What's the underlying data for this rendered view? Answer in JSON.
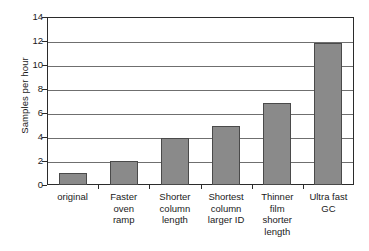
{
  "chart_data": {
    "type": "bar",
    "title": "",
    "xlabel": "",
    "ylabel": "Samples per hour",
    "categories": [
      "original",
      "Faster oven ramp",
      "Shorter column length",
      "Shortest column larger ID",
      "Thinner film shorter length",
      "Ultra fast GC"
    ],
    "category_lines": [
      [
        "original"
      ],
      [
        "Faster",
        "oven",
        "ramp"
      ],
      [
        "Shorter",
        "column",
        "length"
      ],
      [
        "Shortest",
        "column",
        "larger ID"
      ],
      [
        "Thinner",
        "film",
        "shorter",
        "length"
      ],
      [
        "Ultra fast",
        "GC"
      ]
    ],
    "values": [
      1.0,
      2.0,
      3.9,
      4.9,
      6.8,
      11.8
    ],
    "ylim": [
      0,
      14
    ],
    "ytick_labels": [
      "0",
      "2",
      "4",
      "6",
      "8",
      "10",
      "12",
      "14"
    ],
    "ytick_values": [
      0,
      2,
      4,
      6,
      8,
      10,
      12,
      14
    ],
    "grid": "horizontal",
    "legend": "none",
    "colors": {
      "bar_fill": "#8a8a8a",
      "bar_edge": "#4a4a4a",
      "gridline": "#6f6f6f",
      "frame": "#2b2b2b",
      "background": "#ffffff",
      "text": "#1a1a1a"
    }
  }
}
